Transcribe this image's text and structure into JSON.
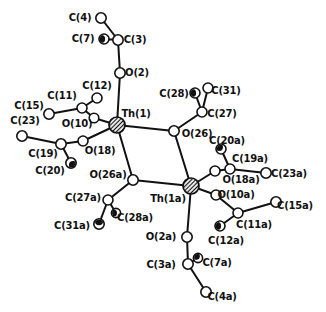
{
  "figure": {
    "type": "molecular-structure-diagram",
    "background_color": "#ffffff",
    "line_color": "#111111",
    "atom_fill_color": "#ffffff",
    "canvas": {
      "width": 326,
      "height": 312
    },
    "atoms": [
      {
        "id": "C4",
        "label": "C(4)",
        "kind": "C",
        "x": 101,
        "y": 18,
        "r": 5.2,
        "shade": null,
        "label_x": 80,
        "label_y": 17
      },
      {
        "id": "C7",
        "label": "C(7)",
        "kind": "C",
        "x": 104,
        "y": 39,
        "r": 5.0,
        "shade": "w",
        "label_x": 83,
        "label_y": 38
      },
      {
        "id": "C3",
        "label": "C(3)",
        "kind": "C",
        "x": 118,
        "y": 40,
        "r": 5.2,
        "shade": null,
        "label_x": 135,
        "label_y": 39
      },
      {
        "id": "O2",
        "label": "O(2)",
        "kind": "O",
        "x": 120,
        "y": 73,
        "r": 5.2,
        "shade": null,
        "label_x": 137,
        "label_y": 72
      },
      {
        "id": "C12",
        "label": "C(12)",
        "kind": "C",
        "x": 97,
        "y": 98,
        "r": 5.0,
        "shade": null,
        "label_x": 97,
        "label_y": 85
      },
      {
        "id": "C11",
        "label": "C(11)",
        "kind": "C",
        "x": 82,
        "y": 108,
        "r": 5.0,
        "shade": null,
        "label_x": 62,
        "label_y": 95
      },
      {
        "id": "C15",
        "label": "C(15)",
        "kind": "C",
        "x": 49,
        "y": 114,
        "r": 5.2,
        "shade": null,
        "label_x": 29,
        "label_y": 105
      },
      {
        "id": "C23",
        "label": "C(23)",
        "kind": "C",
        "x": 22,
        "y": 136,
        "r": 5.2,
        "shade": null,
        "label_x": 25,
        "label_y": 120
      },
      {
        "id": "O10",
        "label": "O(10)",
        "kind": "O",
        "x": 94,
        "y": 118,
        "r": 4.8,
        "shade": null,
        "label_x": 77,
        "label_y": 123
      },
      {
        "id": "Th1",
        "label": "Th(1)",
        "kind": "Th",
        "x": 117,
        "y": 125,
        "r": 8.0,
        "shade": null,
        "label_x": 136,
        "label_y": 113
      },
      {
        "id": "O18",
        "label": "O(18)",
        "kind": "O",
        "x": 83,
        "y": 141,
        "r": 5.0,
        "shade": null,
        "label_x": 100,
        "label_y": 150
      },
      {
        "id": "C19",
        "label": "C(19)",
        "kind": "C",
        "x": 61,
        "y": 144,
        "r": 5.2,
        "shade": null,
        "label_x": 43,
        "label_y": 153
      },
      {
        "id": "C20",
        "label": "C(20)",
        "kind": "C",
        "x": 71,
        "y": 163,
        "r": 5.2,
        "shade": "se",
        "label_x": 50,
        "label_y": 170
      },
      {
        "id": "C28",
        "label": "C(28)",
        "kind": "C",
        "x": 195,
        "y": 93,
        "r": 5.0,
        "shade": "w",
        "label_x": 174,
        "label_y": 93
      },
      {
        "id": "C31",
        "label": "C(31)",
        "kind": "C",
        "x": 208,
        "y": 88,
        "r": 5.0,
        "shade": null,
        "label_x": 226,
        "label_y": 90
      },
      {
        "id": "C27",
        "label": "C(27)",
        "kind": "C",
        "x": 202,
        "y": 112,
        "r": 5.0,
        "shade": null,
        "label_x": 222,
        "label_y": 113
      },
      {
        "id": "O26",
        "label": "O(26)",
        "kind": "O",
        "x": 174,
        "y": 131,
        "r": 5.2,
        "shade": null,
        "label_x": 197,
        "label_y": 133
      },
      {
        "id": "Th1a",
        "label": "Th(1a)",
        "kind": "Th",
        "x": 191,
        "y": 186,
        "r": 8.0,
        "shade": null,
        "label_x": 168,
        "label_y": 198
      },
      {
        "id": "O26a",
        "label": "O(26a)",
        "kind": "O",
        "x": 133,
        "y": 180,
        "r": 5.2,
        "shade": null,
        "label_x": 108,
        "label_y": 174
      },
      {
        "id": "C27a",
        "label": "C(27a)",
        "kind": "C",
        "x": 108,
        "y": 200,
        "r": 5.0,
        "shade": null,
        "label_x": 83,
        "label_y": 197
      },
      {
        "id": "C28a",
        "label": "C(28a)",
        "kind": "C",
        "x": 116,
        "y": 213,
        "r": 4.6,
        "shade": "w",
        "label_x": 135,
        "label_y": 217
      },
      {
        "id": "C31a",
        "label": "C(31a)",
        "kind": "C",
        "x": 99,
        "y": 224,
        "r": 5.2,
        "shade": "n",
        "label_x": 72,
        "label_y": 225
      },
      {
        "id": "C20a",
        "label": "C(20a)",
        "kind": "C",
        "x": 221,
        "y": 149,
        "r": 5.0,
        "shade": "nw",
        "label_x": 227,
        "label_y": 140
      },
      {
        "id": "C19a",
        "label": "C(19a)",
        "kind": "C",
        "x": 230,
        "y": 169,
        "r": 5.0,
        "shade": null,
        "label_x": 250,
        "label_y": 158
      },
      {
        "id": "C23a",
        "label": "C(23a)",
        "kind": "C",
        "x": 266,
        "y": 173,
        "r": 5.2,
        "shade": null,
        "label_x": 289,
        "label_y": 173
      },
      {
        "id": "O18a",
        "label": "O(18a)",
        "kind": "O",
        "x": 215,
        "y": 171,
        "r": 5.0,
        "shade": null,
        "label_x": 241,
        "label_y": 179
      },
      {
        "id": "O10a",
        "label": "O(10a)",
        "kind": "O",
        "x": 216,
        "y": 195,
        "r": 5.0,
        "shade": null,
        "label_x": 236,
        "label_y": 194
      },
      {
        "id": "C11a",
        "label": "C(11a)",
        "kind": "C",
        "x": 238,
        "y": 213,
        "r": 5.0,
        "shade": null,
        "label_x": 254,
        "label_y": 224
      },
      {
        "id": "C15a",
        "label": "C(15a)",
        "kind": "C",
        "x": 276,
        "y": 202,
        "r": 5.2,
        "shade": null,
        "label_x": 295,
        "label_y": 205
      },
      {
        "id": "C12a",
        "label": "C(12a)",
        "kind": "C",
        "x": 220,
        "y": 226,
        "r": 5.0,
        "shade": "w",
        "label_x": 226,
        "label_y": 240
      },
      {
        "id": "O2a",
        "label": "O(2a)",
        "kind": "O",
        "x": 187,
        "y": 237,
        "r": 5.2,
        "shade": null,
        "label_x": 161,
        "label_y": 236
      },
      {
        "id": "C3a",
        "label": "C(3a)",
        "kind": "C",
        "x": 188,
        "y": 264,
        "r": 5.2,
        "shade": null,
        "label_x": 161,
        "label_y": 264
      },
      {
        "id": "C7a",
        "label": "C(7a)",
        "kind": "C",
        "x": 198,
        "y": 258,
        "r": 4.6,
        "shade": "nw",
        "label_x": 217,
        "label_y": 262
      },
      {
        "id": "C4a",
        "label": "C(4a)",
        "kind": "C",
        "x": 206,
        "y": 292,
        "r": 5.2,
        "shade": null,
        "label_x": 222,
        "label_y": 296
      }
    ],
    "bonds": [
      [
        "C4",
        "C3"
      ],
      [
        "C7",
        "C3"
      ],
      [
        "C3",
        "O2"
      ],
      [
        "O2",
        "Th1"
      ],
      [
        "C12",
        "C11"
      ],
      [
        "C15",
        "C11"
      ],
      [
        "C11",
        "O10"
      ],
      [
        "O10",
        "Th1"
      ],
      [
        "C23",
        "C19"
      ],
      [
        "C20",
        "C19"
      ],
      [
        "C19",
        "O18"
      ],
      [
        "O18",
        "Th1"
      ],
      [
        "Th1",
        "O26"
      ],
      [
        "Th1",
        "O26a"
      ],
      [
        "O26",
        "Th1a"
      ],
      [
        "O26a",
        "Th1a"
      ],
      [
        "C28",
        "C27"
      ],
      [
        "C31",
        "C27"
      ],
      [
        "C27",
        "O26"
      ],
      [
        "O26a",
        "C27a"
      ],
      [
        "C27a",
        "C28a"
      ],
      [
        "C27a",
        "C31a"
      ],
      [
        "Th1a",
        "O18a"
      ],
      [
        "O18a",
        "C19a"
      ],
      [
        "C19a",
        "C20a"
      ],
      [
        "C19a",
        "C23a"
      ],
      [
        "Th1a",
        "O10a"
      ],
      [
        "O10a",
        "C11a"
      ],
      [
        "C11a",
        "C15a"
      ],
      [
        "C11a",
        "C12a"
      ],
      [
        "Th1a",
        "O2a"
      ],
      [
        "O2a",
        "C3a"
      ],
      [
        "C3a",
        "C7a"
      ],
      [
        "C3a",
        "C4a"
      ]
    ]
  }
}
